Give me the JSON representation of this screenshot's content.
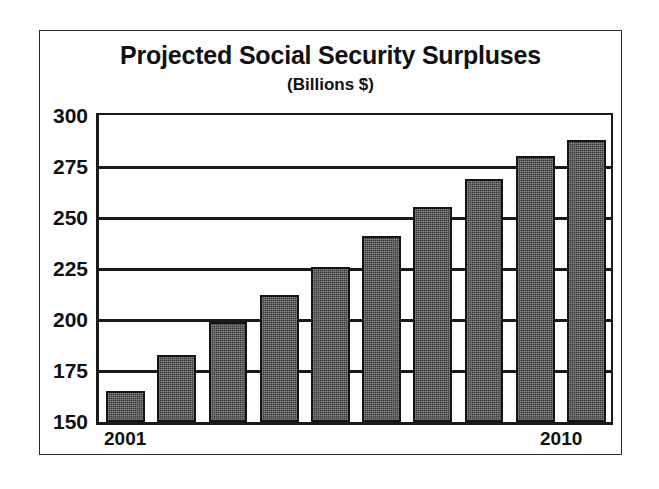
{
  "chart_data": {
    "type": "bar",
    "title": "Projected Social Security Surpluses",
    "subtitle": "(Billions $)",
    "xlabel": "",
    "ylabel": "",
    "unit": "Billions $",
    "categories": [
      "2001",
      "2002",
      "2003",
      "2004",
      "2005",
      "2006",
      "2007",
      "2008",
      "2009",
      "2010"
    ],
    "values": [
      165,
      183,
      199,
      212,
      226,
      241,
      255,
      269,
      280,
      288
    ],
    "ylim": [
      150,
      300
    ],
    "yticks": [
      150,
      175,
      200,
      225,
      250,
      275,
      300
    ],
    "ytick_labels": [
      "150",
      "175",
      "200",
      "225",
      "250",
      "275",
      "300"
    ],
    "xtick_labels_shown": [
      "2001",
      "2010"
    ],
    "grid": true,
    "grid_axis": "y",
    "legend": false,
    "series": [
      {
        "name": "Projected Surplus",
        "values": [
          165,
          183,
          199,
          212,
          226,
          241,
          255,
          269,
          280,
          288
        ]
      }
    ],
    "colors": {
      "bar_fill": "#3a3a3a",
      "bar_edge": "#141414",
      "axis": "#1a1a1a",
      "text": "#111111",
      "background": "#ffffff"
    }
  }
}
